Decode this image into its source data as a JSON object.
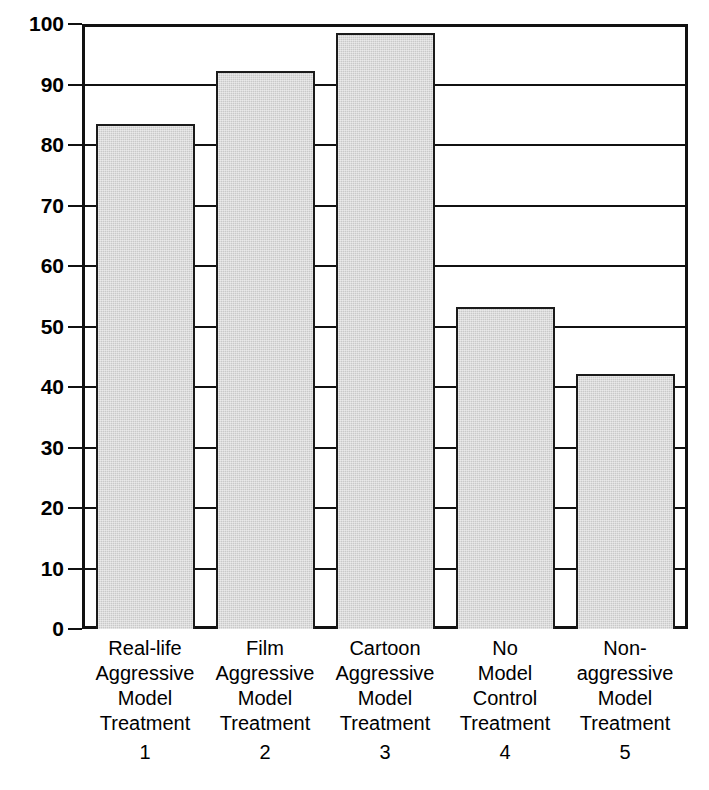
{
  "chart": {
    "type": "bar",
    "title": "",
    "xlabel": "",
    "ylabel": "Mean Number of Aggressive Responses"
  },
  "chart_data": {
    "type": "bar",
    "title": "",
    "xlabel": "",
    "ylabel": "Mean Number of Aggressive Responses",
    "ylim": [
      0,
      100
    ],
    "yticks": [
      0,
      10,
      20,
      30,
      40,
      50,
      60,
      70,
      80,
      90,
      100
    ],
    "grid": true,
    "legend": null,
    "bar_color": "#c9c9c9",
    "bar_edge_color": "#1b1b1b",
    "categories": [
      "Real-life Aggressive Model Treatment 1",
      "Film Aggressive Model Treatment 2",
      "Cartoon Aggressive Model Treatment 3",
      "No Model Control Treatment 4",
      "Non-aggressive Model Treatment 5"
    ],
    "values": [
      83.5,
      92.3,
      98.5,
      53.2,
      42.2
    ]
  },
  "yaxis": {
    "title": "Mean Number of Aggressive Responses",
    "ticks": [
      {
        "value": 100,
        "label": "100"
      },
      {
        "value": 90,
        "label": "90"
      },
      {
        "value": 80,
        "label": "80"
      },
      {
        "value": 70,
        "label": "70"
      },
      {
        "value": 60,
        "label": "60"
      },
      {
        "value": 50,
        "label": "50"
      },
      {
        "value": 40,
        "label": "40"
      },
      {
        "value": 30,
        "label": "30"
      },
      {
        "value": 20,
        "label": "20"
      },
      {
        "value": 10,
        "label": "10"
      },
      {
        "value": 0,
        "label": "0"
      }
    ]
  },
  "xaxis": {
    "categories": [
      {
        "lines": [
          "Real-life",
          "Aggressive",
          "Model",
          "Treatment"
        ],
        "number": "1"
      },
      {
        "lines": [
          "Film",
          "Aggressive",
          "Model",
          "Treatment"
        ],
        "number": "2"
      },
      {
        "lines": [
          "Cartoon",
          "Aggressive",
          "Model",
          "Treatment"
        ],
        "number": "3"
      },
      {
        "lines": [
          "No",
          "Model",
          "Control",
          "Treatment"
        ],
        "number": "4"
      },
      {
        "lines": [
          "Non-",
          "aggressive",
          "Model",
          "Treatment"
        ],
        "number": "5"
      }
    ]
  }
}
